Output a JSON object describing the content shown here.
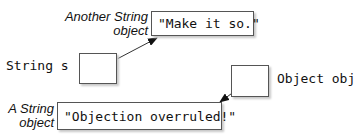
{
  "variables": [
    {
      "label": "String s"
    },
    {
      "label": "Object obj"
    }
  ],
  "objects": [
    {
      "value": "\"Make it so.\"",
      "caption_line1": "Another String",
      "caption_line2": "object"
    },
    {
      "value": "\"Objection overruled!\"",
      "caption_line1": "A String",
      "caption_line2": "object"
    }
  ],
  "colors": {
    "line": "#333333",
    "box_border": "#555555",
    "shadow": "#c8c8c8"
  }
}
